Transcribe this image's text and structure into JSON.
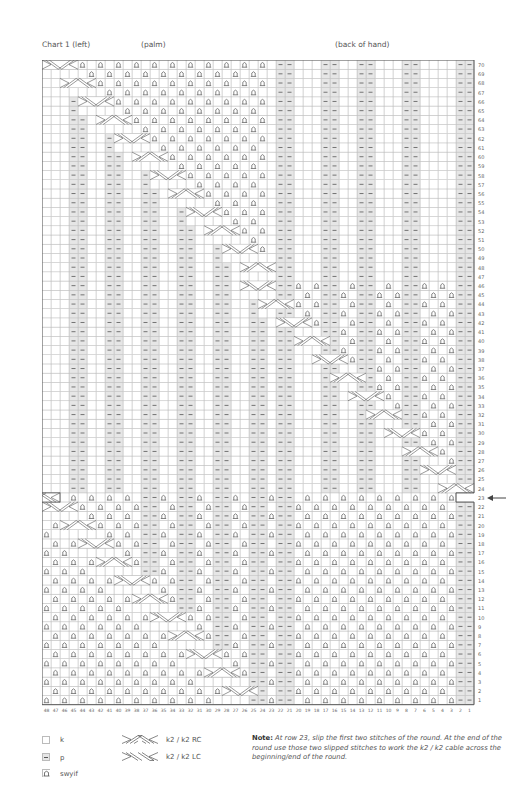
{
  "header": {
    "chart_title": "Chart 1 (left)",
    "palm_label": "(palm)",
    "back_label": "(back of hand)"
  },
  "grid": {
    "columns": 48,
    "rows": 70,
    "cell_w": 9,
    "cell_h": 9.21,
    "colors": {
      "line": "#bdbdbd",
      "purl_fill": "#e6e6e6",
      "border": "#555555",
      "symbol": "#555555"
    },
    "purl_rib_columns": [
      22,
      21,
      17,
      16,
      13,
      12,
      8,
      7,
      2,
      1
    ],
    "palm_purl_pairs_note": "diagonal purl pairs follow traveling cables on palm",
    "special_row": 23,
    "special_row_arrow": true
  },
  "column_labels": [
    "48",
    "47",
    "46",
    "45",
    "44",
    "43",
    "42",
    "41",
    "40",
    "39",
    "38",
    "37",
    "36",
    "35",
    "34",
    "33",
    "32",
    "31",
    "30",
    "29",
    "28",
    "27",
    "26",
    "25",
    "24",
    "23",
    "22",
    "21",
    "20",
    "19",
    "18",
    "17",
    "16",
    "15",
    "14",
    "13",
    "12",
    "11",
    "10",
    "9",
    "8",
    "7",
    "6",
    "5",
    "4",
    "3",
    "2",
    "1"
  ],
  "legend": {
    "items": [
      {
        "symbol": "k",
        "label": "k"
      },
      {
        "symbol": "p",
        "label": "p"
      },
      {
        "symbol": "swyif",
        "label": "swyif"
      },
      {
        "symbol": "rc",
        "label": "k2 / k2 RC"
      },
      {
        "symbol": "lc",
        "label": "k2 / k2 LC"
      }
    ]
  },
  "note": {
    "bold": "Note:",
    "text": "At row 23, slip the first two stitches of the round.  At the end of the round use those two slipped stitches to work the k2 / k2 cable across the beginning/end of the round."
  }
}
